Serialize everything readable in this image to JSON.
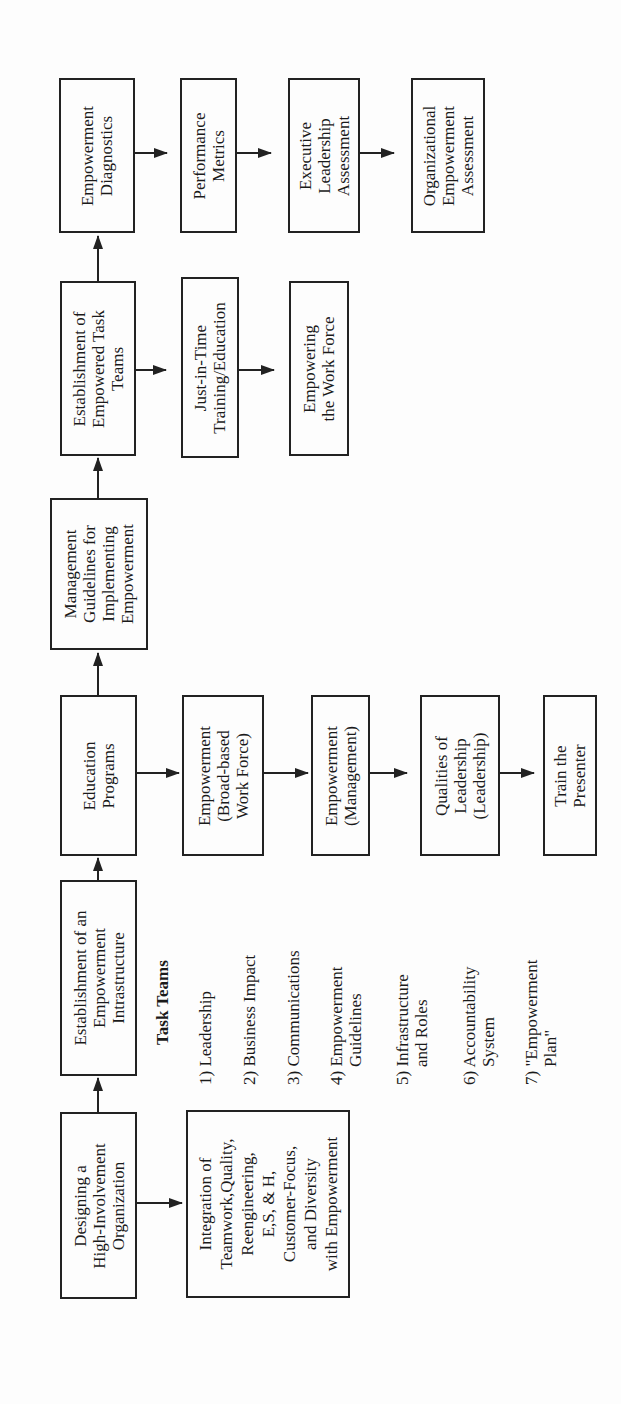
{
  "diagram": {
    "type": "flowchart",
    "orientation": "rotated-90-ccw",
    "main_sequence": [
      {
        "id": "designing",
        "lines": [
          "Designing a",
          "High-Involvement",
          "Organization"
        ]
      },
      {
        "id": "infrastructure",
        "lines": [
          "Establishment of an",
          "Empowerment",
          "Intrastructure"
        ]
      },
      {
        "id": "education",
        "lines": [
          "Education",
          "Programs"
        ]
      },
      {
        "id": "mgmt_guidelines",
        "lines": [
          "Management",
          "Guidelines for",
          "Implementing",
          "Empowerment"
        ]
      },
      {
        "id": "task_teams_est",
        "lines": [
          "Establishment of",
          "Empowered Task",
          "Teams"
        ]
      },
      {
        "id": "diagnostics",
        "lines": [
          "Empowerment",
          "Diagnostics"
        ]
      }
    ],
    "branches": {
      "designing": [
        {
          "id": "integration",
          "lines": [
            "Integration of",
            "Teamwork,Quality,",
            "Reengineering,",
            "E,S, & H,",
            "Customer-Focus,",
            "and Diversity",
            "with Empowerment"
          ]
        }
      ],
      "education": [
        {
          "id": "broad_based",
          "lines": [
            "Empowerment",
            "(Broad-based",
            "Work Force)"
          ]
        },
        {
          "id": "management",
          "lines": [
            "Empowerment",
            "(Management)"
          ]
        },
        {
          "id": "qualities",
          "lines": [
            "Qualities of",
            "Leadership",
            "(Leadership)"
          ]
        },
        {
          "id": "train",
          "lines": [
            "Train the",
            "Presenter"
          ]
        }
      ],
      "task_teams_est": [
        {
          "id": "jit",
          "lines": [
            "Just-in-Time",
            "Training/Education"
          ]
        },
        {
          "id": "empowering",
          "lines": [
            "Empowering",
            "the Work Force"
          ]
        }
      ],
      "diagnostics": [
        {
          "id": "performance",
          "lines": [
            "Performance",
            "Metrics"
          ]
        },
        {
          "id": "executive",
          "lines": [
            "Executive",
            "Leadership",
            "Assessment"
          ]
        },
        {
          "id": "organizational",
          "lines": [
            "Organizational",
            "Empowerment",
            "Assessment"
          ]
        }
      ]
    },
    "task_teams": {
      "title": "Task Teams",
      "items": [
        {
          "lines": [
            "1) Leadership"
          ]
        },
        {
          "lines": [
            "2) Business Impact"
          ]
        },
        {
          "lines": [
            "3) Communications"
          ]
        },
        {
          "lines": [
            "4) Empowerment",
            "    Guidelines"
          ]
        },
        {
          "lines": [
            "5) Infrastructure",
            "    and Roles"
          ]
        },
        {
          "lines": [
            "6) Accountability",
            "    System"
          ]
        },
        {
          "lines": [
            "7) \"Empowerment",
            "    Plan\""
          ]
        }
      ]
    }
  }
}
